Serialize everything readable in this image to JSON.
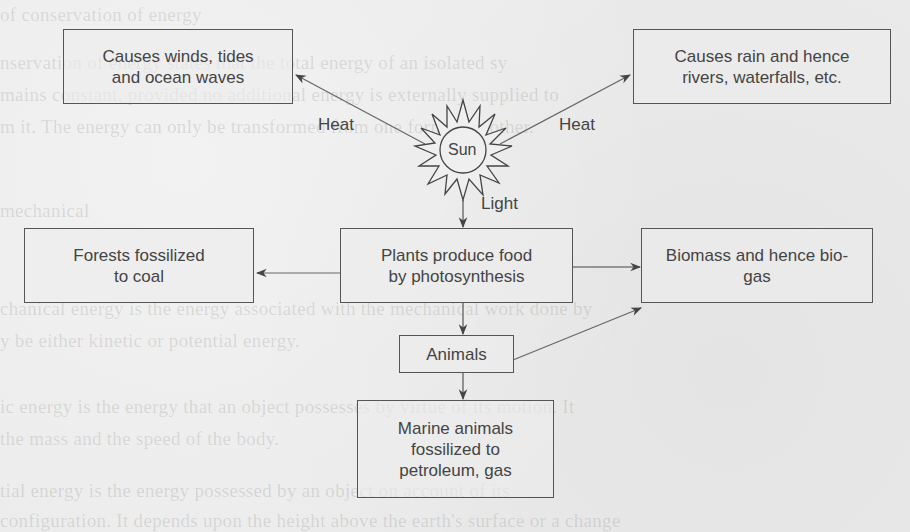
{
  "diagram": {
    "center": {
      "label": "Sun",
      "icon": "sun-icon"
    },
    "nodes": {
      "winds": "Causes winds, tides\nand ocean waves",
      "rain": "Causes rain and hence\nrivers, waterfalls, etc.",
      "forests": "Forests fossilized\nto coal",
      "plants": "Plants produce food\nby photosynthesis",
      "biomass": "Biomass and hence bio-\ngas",
      "animals": "Animals",
      "marine": "Marine animals\nfossilized to\npetroleum, gas"
    },
    "edge_labels": {
      "heat_left": "Heat",
      "heat_right": "Heat",
      "light": "Light"
    },
    "edges": [
      {
        "from": "Sun",
        "to": "winds",
        "label": "Heat"
      },
      {
        "from": "Sun",
        "to": "rain",
        "label": "Heat"
      },
      {
        "from": "Sun",
        "to": "plants",
        "label": "Light"
      },
      {
        "from": "plants",
        "to": "forests"
      },
      {
        "from": "plants",
        "to": "biomass"
      },
      {
        "from": "plants",
        "to": "animals"
      },
      {
        "from": "animals",
        "to": "biomass"
      },
      {
        "from": "animals",
        "to": "marine"
      }
    ]
  },
  "background_bleed": {
    "lines": [
      "                                          of conservation of energy",
      "                             nservation of energy states that the total energy of an isolated sy",
      "                          mains constant, provided no additional energy is externally supplied to",
      "                       m it. The energy can only be transformed from one form to another.",
      "                                                                                     mechanical",
      "         chanical energy is the energy associated with the mechanical work done by",
      "        y be either kinetic or potential energy.",
      "        ic energy is the energy that an object possesses by virtue of its motion. It",
      "        the mass and the speed of the body.",
      "        tial energy is the energy possessed by an object on account of its",
      "        configuration. It depends upon the height above the earth's surface or a change"
    ]
  }
}
